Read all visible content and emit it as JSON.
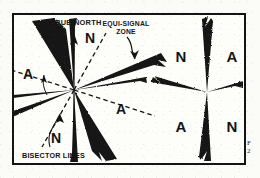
{
  "page": {
    "background_color": "#fbfbf8",
    "frame_border_color": "#141414",
    "ink_color": "#141414"
  },
  "figure": {
    "name": "radio-range-equi-signal-zone-diagram",
    "caption_fragment_line1": "F",
    "caption_fragment_line2": "2",
    "labels": {
      "true_north": "TRUE NORTH",
      "equi_signal_zone_line1": "EQUI-SIGNAL",
      "equi_signal_zone_line2": "ZONE",
      "bisector_lines": "BISECTOR LINES"
    },
    "left_diagram": {
      "name": "four-course-radio-range-pattern",
      "center": {
        "x": 72,
        "y": 88
      },
      "code_letters": [
        {
          "id": "n-top",
          "text": "N",
          "x": 88,
          "y": 36
        },
        {
          "id": "a-left",
          "text": "A",
          "x": 25,
          "y": 71
        },
        {
          "id": "a-right",
          "text": "A",
          "x": 119,
          "y": 107
        },
        {
          "id": "n-bottom",
          "text": "N",
          "x": 54,
          "y": 136
        }
      ],
      "lobes_deg": [
        12,
        58,
        102,
        148,
        192,
        238,
        282,
        328
      ],
      "bisector_deg": [
        35,
        125,
        215,
        305
      ]
    },
    "right_diagram": {
      "name": "quadrant-signal-identification-pattern",
      "center": {
        "x": 205,
        "y": 90
      },
      "quadrants": [
        {
          "id": "upper-left",
          "text": "N",
          "x": 180,
          "y": 54
        },
        {
          "id": "upper-right",
          "text": "A",
          "x": 230,
          "y": 54
        },
        {
          "id": "lower-left",
          "text": "A",
          "x": 180,
          "y": 125
        },
        {
          "id": "lower-right",
          "text": "N",
          "x": 230,
          "y": 125
        }
      ]
    }
  }
}
